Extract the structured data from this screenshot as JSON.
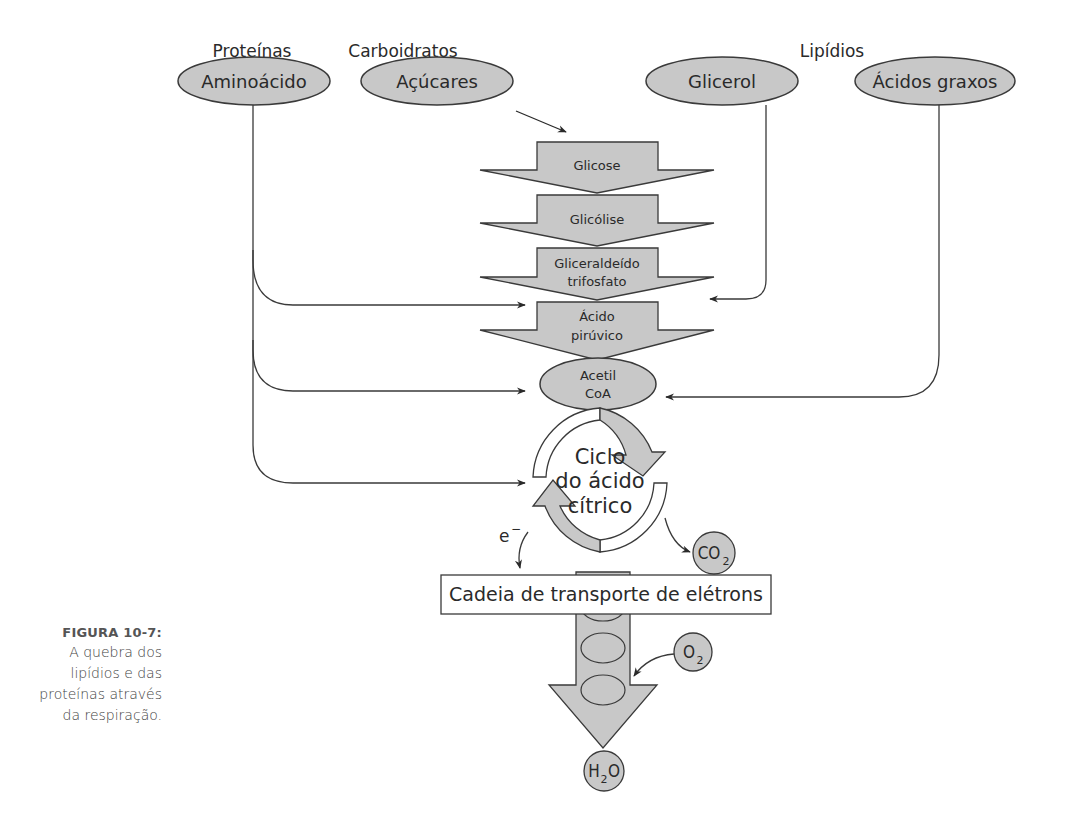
{
  "figure": {
    "label": "FIGURA 10-7:",
    "caption": "A quebra dos lipídios e das proteínas através da respiração."
  },
  "categories": {
    "proteins": "Proteínas",
    "carbohydrates": "Carboidratos",
    "lipids": "Lipídios"
  },
  "sources": {
    "amino_acid": "Aminoácido",
    "sugars": "Açúcares",
    "glycerol": "Glicerol",
    "fatty_acids": "Ácidos graxos"
  },
  "pathway_steps": [
    {
      "line1": "Glicose",
      "line2": ""
    },
    {
      "line1": "Glicólise",
      "line2": ""
    },
    {
      "line1": "Gliceraldeído",
      "line2": "trifosfato"
    },
    {
      "line1": "Ácido",
      "line2": "pirúvico"
    }
  ],
  "acetyl_coa": {
    "line1": "Acetil",
    "line2": "CoA"
  },
  "krebs_cycle": {
    "line1": "Ciclo",
    "line2": "do ácido",
    "line3": "cítrico"
  },
  "electron_label": "e",
  "electron_charge": "−",
  "etc_label": "Cadeia de transporte de elétrons",
  "molecules": {
    "co2": {
      "main": "CO",
      "sub": "2"
    },
    "o2": {
      "main": "O",
      "sub": "2"
    },
    "h2o": {
      "pre": "H",
      "sub": "2",
      "post": "O"
    }
  },
  "colors": {
    "fill": "#c8c8c8",
    "stroke": "#3a3a3a",
    "text": "#2a2a2a",
    "background": "#ffffff"
  }
}
